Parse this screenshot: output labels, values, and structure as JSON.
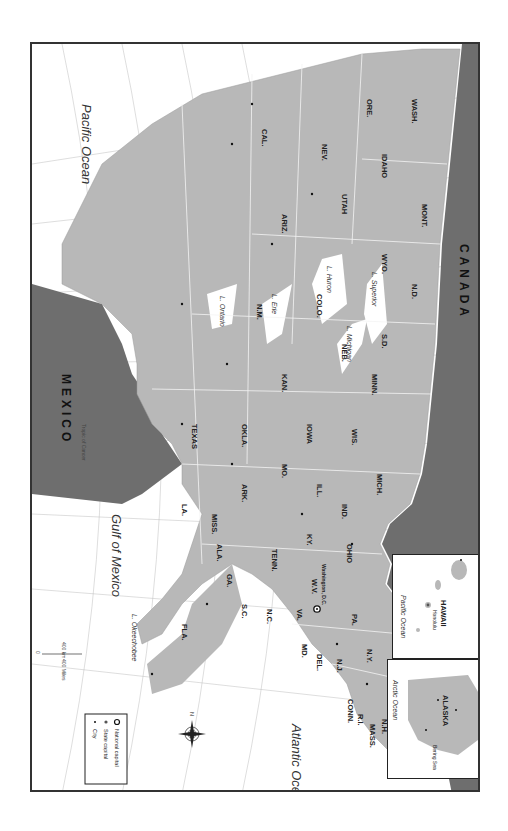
{
  "map": {
    "title": "United States",
    "orientation": "rotated 90 degrees clockwise; north points left",
    "colors": {
      "us_land": "#b8b8b8",
      "foreign_land": "#6e6e6e",
      "water": "#ffffff",
      "state_border": "#f2f2f2",
      "frame": "#333333"
    },
    "countries": [
      {
        "name": "CANADA",
        "x": 62,
        "y": 40
      },
      {
        "name": "MEXICO",
        "x": 385,
        "y": 92
      }
    ],
    "water_bodies": [
      {
        "name": "Atlantic Ocean",
        "x": 700,
        "y": 100,
        "size": "large"
      },
      {
        "name": "Gulf of Mexico",
        "x": 420,
        "y": 640,
        "size": "large"
      },
      {
        "name": "Pacific Ocean",
        "x": 130,
        "y": 680,
        "size": "large"
      },
      {
        "name": "L. Superior",
        "x": 240,
        "y": 98,
        "size": "small"
      },
      {
        "name": "L. Michigan",
        "x": 282,
        "y": 125,
        "size": "small"
      },
      {
        "name": "L. Huron",
        "x": 236,
        "y": 155,
        "size": "small"
      },
      {
        "name": "L. Erie",
        "x": 258,
        "y": 212,
        "size": "small"
      },
      {
        "name": "L. Ontario",
        "x": 250,
        "y": 262,
        "size": "small"
      },
      {
        "name": "L. Okeechobee",
        "x": 598,
        "y": 422,
        "size": "small"
      }
    ],
    "rivers": [
      {
        "name": "St. Lawrence R.",
        "x": 210,
        "y": 290
      },
      {
        "name": "Mississippi R.",
        "x": 255,
        "y": 162
      },
      {
        "name": "Mississippi R.",
        "x": 330,
        "y": 245
      },
      {
        "name": "Missouri R.",
        "x": 260,
        "y": 115
      },
      {
        "name": "Missouri R.",
        "x": 205,
        "y": 60
      },
      {
        "name": "Ohio R.",
        "x": 297,
        "y": 225
      },
      {
        "name": "Arkansas R.",
        "x": 348,
        "y": 215
      },
      {
        "name": "Red R.",
        "x": 375,
        "y": 195
      },
      {
        "name": "Platte R.",
        "x": 262,
        "y": 180
      },
      {
        "name": "Rio Grande",
        "x": 452,
        "y": 162
      },
      {
        "name": "Colorado R.",
        "x": 322,
        "y": 70
      },
      {
        "name": "Snake R.",
        "x": 197,
        "y": 55
      },
      {
        "name": "Columbia R.",
        "x": 102,
        "y": 78
      }
    ],
    "states": [
      {
        "abbr": "ME.",
        "x": 700,
        "y": 50
      },
      {
        "abbr": "N.H.",
        "x": 660,
        "y": 75
      },
      {
        "abbr": "VT.",
        "x": 640,
        "y": 88
      },
      {
        "abbr": "MASS.",
        "x": 680,
        "y": 85
      },
      {
        "abbr": "R.I.",
        "x": 660,
        "y": 100
      },
      {
        "abbr": "CONN.",
        "x": 640,
        "y": 110
      },
      {
        "abbr": "N.Y.",
        "x": 600,
        "y": 90
      },
      {
        "abbr": "N.J.",
        "x": 600,
        "y": 125
      },
      {
        "abbr": "DEL.",
        "x": 590,
        "y": 145
      },
      {
        "abbr": "MD.",
        "x": 572,
        "y": 150
      },
      {
        "abbr": "PA.",
        "x": 570,
        "y": 110
      },
      {
        "abbr": "VA.",
        "x": 540,
        "y": 150
      },
      {
        "abbr": "W.V.",
        "x": 540,
        "y": 135
      },
      {
        "abbr": "OHIO",
        "x": 525,
        "y": 115
      },
      {
        "abbr": "MICH.",
        "x": 490,
        "y": 105
      },
      {
        "abbr": "IND.",
        "x": 495,
        "y": 130
      },
      {
        "abbr": "KY.",
        "x": 500,
        "y": 150
      },
      {
        "abbr": "N.C.",
        "x": 530,
        "y": 180
      },
      {
        "abbr": "S.C.",
        "x": 510,
        "y": 190
      },
      {
        "abbr": "TENN.",
        "x": 480,
        "y": 170
      },
      {
        "abbr": "GA.",
        "x": 490,
        "y": 205
      },
      {
        "abbr": "ALA.",
        "x": 460,
        "y": 210
      },
      {
        "abbr": "MISS.",
        "x": 440,
        "y": 215
      },
      {
        "abbr": "FLA.",
        "x": 470,
        "y": 245
      },
      {
        "abbr": "LA.",
        "x": 420,
        "y": 225
      },
      {
        "abbr": "ARK.",
        "x": 430,
        "y": 190
      },
      {
        "abbr": "TEXAS",
        "x": 390,
        "y": 215
      },
      {
        "abbr": "OKLA.",
        "x": 410,
        "y": 180
      },
      {
        "abbr": "MO.",
        "x": 450,
        "y": 160
      },
      {
        "abbr": "ILL.",
        "x": 470,
        "y": 140
      },
      {
        "abbr": "IOWA",
        "x": 450,
        "y": 120
      },
      {
        "abbr": "WIS.",
        "x": 470,
        "y": 100
      },
      {
        "abbr": "MINN.",
        "x": 440,
        "y": 90
      },
      {
        "abbr": "N.D.",
        "x": 410,
        "y": 75
      },
      {
        "abbr": "S.D.",
        "x": 420,
        "y": 100
      },
      {
        "abbr": "NEB.",
        "x": 420,
        "y": 125
      },
      {
        "abbr": "KAN.",
        "x": 420,
        "y": 150
      },
      {
        "abbr": "MONT.",
        "x": 380,
        "y": 60
      },
      {
        "abbr": "WYO.",
        "x": 390,
        "y": 100
      },
      {
        "abbr": "COLO.",
        "x": 395,
        "y": 140
      },
      {
        "abbr": "N.M.",
        "x": 375,
        "y": 165
      },
      {
        "abbr": "IDAHO",
        "x": 360,
        "y": 75
      },
      {
        "abbr": "UTAH",
        "x": 365,
        "y": 110
      },
      {
        "abbr": "ARIZ.",
        "x": 355,
        "y": 145
      },
      {
        "abbr": "WASH.",
        "x": 340,
        "y": 50
      },
      {
        "abbr": "ORE.",
        "x": 330,
        "y": 70
      },
      {
        "abbr": "NEV.",
        "x": 340,
        "y": 100
      },
      {
        "abbr": "CAL.",
        "x": 320,
        "y": 115
      },
      {
        "abbr": "ALASKA",
        "x": 0,
        "y": 0
      },
      {
        "abbr": "HAWAII",
        "x": 0,
        "y": 0
      }
    ],
    "national_capital": {
      "name": "Washington, D.C."
    },
    "state_capitals": [
      "Augusta",
      "Concord",
      "Montpelier",
      "Boston",
      "Providence",
      "Hartford",
      "Albany",
      "Trenton",
      "Dover",
      "Annapolis",
      "Harrisburg",
      "Richmond",
      "Charleston",
      "Columbus",
      "Lansing",
      "Indianapolis",
      "Frankfort",
      "Raleigh",
      "Columbia",
      "Nashville",
      "Atlanta",
      "Montgomery",
      "Jackson",
      "Tallahassee",
      "Baton Rouge",
      "Little Rock",
      "Austin",
      "Oklahoma City",
      "Jefferson City",
      "Springfield",
      "Des Moines",
      "Madison",
      "St. Paul",
      "Bismarck",
      "Pierre",
      "Lincoln",
      "Topeka",
      "Helena",
      "Cheyenne",
      "Denver",
      "Santa Fe",
      "Boise",
      "Salt Lake City",
      "Phoenix",
      "Olympia",
      "Salem",
      "Carson City",
      "Sacramento",
      "Juneau",
      "Honolulu"
    ],
    "cities": [
      "Portland",
      "New York City",
      "Newark",
      "Philadelphia",
      "Baltimore",
      "Norfolk",
      "Buffalo",
      "Cleveland",
      "Detroit",
      "Toledo",
      "Cincinnati",
      "Louisville",
      "Chicago",
      "Milwaukee",
      "Charlotte",
      "Greenville",
      "Savannah",
      "Charleston",
      "Jacksonville",
      "Miami",
      "Birmingham",
      "Memphis",
      "Meridian",
      "New Orleans",
      "Pine Bluff",
      "Houston",
      "San Antonio",
      "Dallas",
      "Ft. Worth",
      "Tulsa",
      "Amarillo",
      "El Paso",
      "Albuquerque",
      "Kansas City",
      "St. Louis",
      "Springfield",
      "Omaha",
      "Dubuque",
      "Cedar Rapids",
      "Minneapolis",
      "Duluth",
      "Fargo",
      "Sioux Falls",
      "Salina",
      "Dodge City",
      "Greeley",
      "Colorado Springs",
      "Pueblo",
      "Durango",
      "Casper",
      "Billings",
      "Ogden",
      "Provo",
      "Cedar City",
      "Pocatello",
      "Coeur d'Alene",
      "Flagstaff",
      "Tucson",
      "Las Vegas",
      "Winnemucca",
      "Reno",
      "Fresno",
      "Bakersfield",
      "Los Angeles",
      "San Diego",
      "San Francisco",
      "Eugene",
      "Tacoma",
      "Seattle",
      "Fairbanks",
      "Anchorage",
      "Nome",
      "Hilo"
    ],
    "graticule": {
      "longitudes": [
        "65°",
        "70°",
        "75°",
        "80°",
        "85°",
        "90°",
        "95°",
        "100°",
        "105°",
        "110°",
        "115°",
        "120°",
        "130°"
      ],
      "latitudes": [
        "45°",
        "40°",
        "35°",
        "30°",
        "25°"
      ],
      "tropic_label": "Tropic of Cancer"
    },
    "inset_alaska": {
      "title": "ALASKA",
      "water": [
        "Arctic Ocean",
        "Pacific Ocean",
        "Bering Sea"
      ],
      "cities": [
        "Fairbanks",
        "Anchorage",
        "Nome",
        "Juneau"
      ],
      "grid": [
        "115°",
        "120°",
        "25°"
      ]
    },
    "inset_hawaii": {
      "title": "HAWAII",
      "water": [
        "Pacific Ocean"
      ],
      "cities": [
        "Honolulu",
        "Hilo"
      ],
      "grid": [
        "110°"
      ]
    },
    "scale_bar": {
      "km_label": "400 km",
      "miles_label": "400 Miles",
      "zero": "0"
    },
    "compass": {
      "north_label": "N"
    },
    "legend": {
      "items": [
        {
          "symbol": "national-capital",
          "label": "National capital"
        },
        {
          "symbol": "state-capital",
          "label": "State capital"
        },
        {
          "symbol": "city",
          "label": "City"
        }
      ]
    }
  }
}
